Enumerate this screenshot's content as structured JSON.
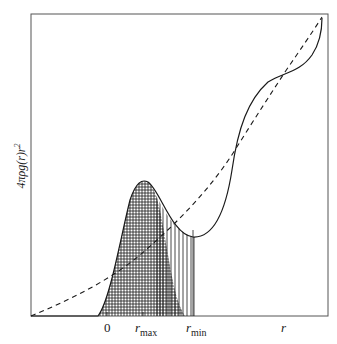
{
  "diagram": {
    "title": "",
    "y_axis_label": {
      "prefix": "4",
      "pi": "π",
      "body": "ρg(r)r",
      "exponent": "2"
    },
    "x_axis_ticks": [
      {
        "text": "0",
        "sub": ""
      },
      {
        "text": "r",
        "sub": "max"
      },
      {
        "text": "r",
        "sub": "min"
      },
      {
        "text": "r",
        "sub": ""
      }
    ],
    "curves": [
      {
        "name": "radial-distribution",
        "style": "solid",
        "color": "#1a1a1a"
      },
      {
        "name": "uniform-density-reference",
        "style": "dashed",
        "color": "#1a1a1a"
      }
    ],
    "shaded_regions": [
      {
        "name": "first-peak-area",
        "pattern": "crosshatch",
        "from": "0",
        "to": "rmax-tail"
      },
      {
        "name": "first-shell-area",
        "pattern": "vertical-lines",
        "from": "rmax",
        "to": "rmin"
      }
    ],
    "colors": {
      "ink": "#1a1a1a",
      "frame": "#555555",
      "background": "#ffffff"
    }
  }
}
